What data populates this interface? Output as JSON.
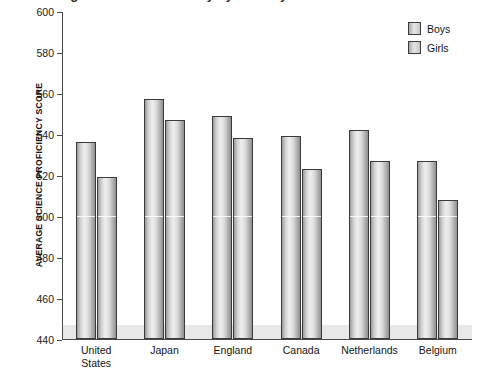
{
  "chart_data": {
    "type": "bar",
    "title": "Average Science Proficiency by Country",
    "xlabel": "",
    "ylabel": "AVERAGE SCIENCE PROFICIENCY SCORE",
    "ylim": [
      440,
      600
    ],
    "ytick_step": 20,
    "yticks": [
      "600",
      "580",
      "560",
      "540",
      "520",
      "500",
      "480",
      "460",
      "440"
    ],
    "grid": false,
    "legend_position": "top-right",
    "categories": [
      "United\nStates",
      "Japan",
      "England",
      "Canada",
      "Netherlands",
      "Belgium"
    ],
    "series": [
      {
        "name": "Boys",
        "values": [
          536,
          557,
          549,
          539,
          542,
          527
        ]
      },
      {
        "name": "Girls",
        "values": [
          519,
          547,
          538,
          523,
          527,
          508
        ]
      }
    ]
  },
  "legend": {
    "items": [
      {
        "label": "Boys"
      },
      {
        "label": "Girls"
      }
    ]
  }
}
